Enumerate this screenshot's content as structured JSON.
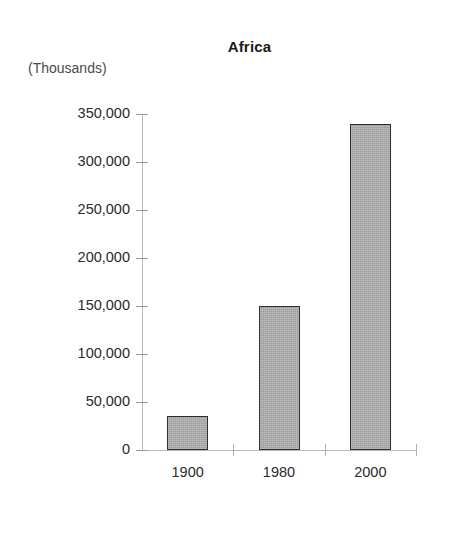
{
  "chart_data": {
    "type": "bar",
    "title": "Africa",
    "units_label": "(Thousands)",
    "xlabel": "",
    "ylabel": "",
    "categories": [
      "1900",
      "1980",
      "2000"
    ],
    "values": [
      35000,
      150000,
      340000
    ],
    "ylim": [
      0,
      350000
    ],
    "ytick_labels": [
      "350,000",
      "300,000",
      "250,000",
      "200,000",
      "150,000",
      "100,000",
      "50,000",
      "0"
    ],
    "ytick_values": [
      350000,
      300000,
      250000,
      200000,
      150000,
      100000,
      50000,
      0
    ],
    "grid": false,
    "legend": false,
    "bar_fill_color": "#a9a9a9",
    "bar_border_color": "#2e2e2e",
    "axis_color": "#b9b9b9",
    "text_color": "#2b2b2b"
  }
}
